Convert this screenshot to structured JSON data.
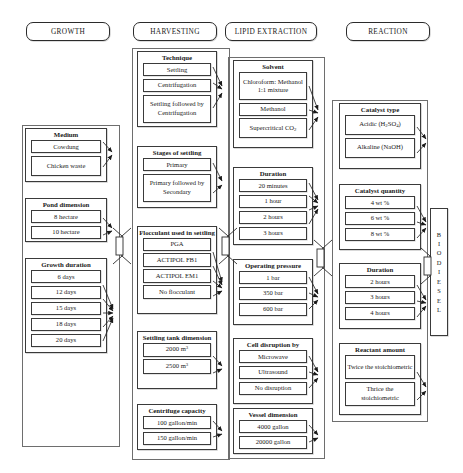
{
  "diagram": {
    "output_label": "BIODIESEL",
    "output_letters": [
      "B",
      "I",
      "O",
      "D",
      "I",
      "E",
      "S",
      "E",
      "L"
    ],
    "stages": [
      {
        "id": "growth",
        "header": "GROWTH",
        "groups": [
          {
            "title": "Medium",
            "options": [
              "Cowdung",
              "Chicken waste"
            ]
          },
          {
            "title": "Pond dimension",
            "options": [
              "8 hectare",
              "10 hectare"
            ]
          },
          {
            "title": "Growth duration",
            "options": [
              "6 days",
              "12 days",
              "15 days",
              "18 days",
              "20 days"
            ]
          }
        ]
      },
      {
        "id": "harvesting",
        "header": "HARVESTING",
        "groups": [
          {
            "title": "Technique",
            "options": [
              "Settling",
              "Centrifugation",
              "Settling followed by Centrifugation"
            ]
          },
          {
            "title": "Stages of settling",
            "options": [
              "Primary",
              "Primary followed by Secondary"
            ]
          },
          {
            "title": "Flocculant used in settling",
            "options": [
              "PGA",
              "ACTIPOL FB1",
              "ACTIPOL EM1",
              "No flocculant"
            ]
          },
          {
            "title": "Settling tank dimension",
            "options": [
              "2000 m3",
              "2500 m3"
            ]
          },
          {
            "title": "Centrifuge capacity",
            "options": [
              "100 gallon/min",
              "150 gallon/min"
            ]
          }
        ]
      },
      {
        "id": "lipid-extraction",
        "header": "LIPID EXTRACTION",
        "groups": [
          {
            "title": "Solvent",
            "options": [
              "Chloroform: Methanol 1:1 mixture",
              "Methanol",
              "Supercritical CO2"
            ]
          },
          {
            "title": "Duration",
            "options": [
              "20 minutes",
              "1 hour",
              "2 hours",
              "3 hours"
            ]
          },
          {
            "title": "Operating pressure",
            "options": [
              "1 bar",
              "350 bar",
              "600 bar"
            ]
          },
          {
            "title": "Cell disruption by",
            "options": [
              "Microwave",
              "Ultrasound",
              "No disruption"
            ]
          },
          {
            "title": "Vessel dimension",
            "options": [
              "4000 gallon",
              "20000 gallon"
            ]
          }
        ]
      },
      {
        "id": "reaction",
        "header": "REACTION",
        "groups": [
          {
            "title": "Catalyst type",
            "options": [
              "Acidic (H2SO4)",
              "Alkaline (NaOH)"
            ]
          },
          {
            "title": "Catalyst quantity",
            "options": [
              "4 wt %",
              "6 wt %",
              "8 wt %"
            ]
          },
          {
            "title": "Duration",
            "options": [
              "2 hours",
              "3 hours",
              "4 hours"
            ]
          },
          {
            "title": "Reactant amount",
            "options": [
              "Twice the stoichiometric",
              "Thrice the stoichiometric"
            ]
          }
        ]
      }
    ]
  },
  "colors": {
    "line": "#3a3a3a",
    "frame": "#6e6e6e",
    "background": "#ffffff"
  }
}
